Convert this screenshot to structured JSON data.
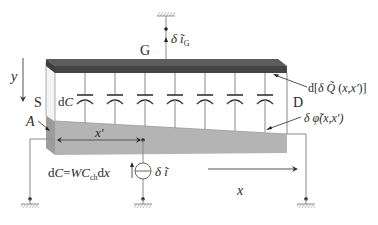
{
  "diagram": {
    "type": "MOSFET channel small-signal noise model",
    "terminals": {
      "gate": "G",
      "source": "S",
      "drain": "D"
    },
    "labels": {
      "gate_current": "δ ĩ",
      "gate_current_sub": "G",
      "charge": "d[δ Q̃ (x,x′)]",
      "potential": "δ φ̃(x,x′)",
      "capacitance": "dC",
      "capacitance_formula_left": "dC=WC",
      "capacitance_formula_sub": "ch",
      "capacitance_formula_right": "dx",
      "noise_current": "δ ĩ",
      "point_a": "A",
      "x_prime": "x′",
      "x_axis": "x",
      "y_axis": "y"
    },
    "capacitor_count": 7,
    "colors": {
      "gate_dark": "#4a4a4a",
      "gate_top": "#5c5c5c",
      "channel_gray": "#b4b4b4",
      "channel_front": "#9c9c9c",
      "side_face": "#f2f2f2",
      "line": "#8a8a8a"
    }
  }
}
